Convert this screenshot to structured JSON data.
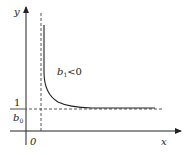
{
  "diagram": {
    "title": "",
    "axes": {
      "x_label": "x",
      "y_label": "y",
      "origin_label": "0"
    },
    "asymptote_label": {
      "numerator": "1",
      "denominator_base": "b",
      "denominator_sub": "0"
    },
    "curve_label": {
      "base": "b",
      "sub": "1",
      "relation": "<0"
    },
    "colors": {
      "ink": "#222222",
      "dash": "#444444",
      "background": "#ffffff"
    }
  }
}
